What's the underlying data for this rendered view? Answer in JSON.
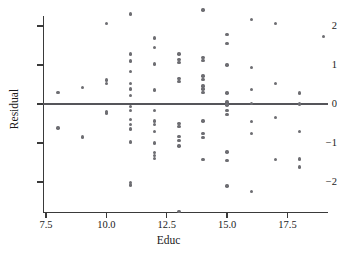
{
  "chart_data": {
    "type": "scatter",
    "title": "",
    "xlabel": "Educ",
    "ylabel": "Residual",
    "xlim": [
      7.2,
      19.6
    ],
    "ylim": [
      -2.85,
      2.55
    ],
    "xticks": [
      7.5,
      10.0,
      12.5,
      15.0,
      17.5
    ],
    "xticklabels": [
      "7.5",
      "10.0",
      "12.5",
      "15.0",
      "17.5"
    ],
    "yticks": [
      2,
      1,
      0,
      -1,
      -2
    ],
    "yticklabels": [
      "2",
      "1",
      "0",
      "−2",
      "−1"
    ],
    "ytick_labels": [
      "2",
      "1",
      "0",
      "−1",
      "−2"
    ],
    "grid": false,
    "legend": null,
    "marker_color": "#6d6d72",
    "reference_line": {
      "type": "horizontal",
      "y": 0,
      "color": "#55555a"
    },
    "points": [
      [
        8,
        0.29
      ],
      [
        8,
        -0.62
      ],
      [
        9,
        0.42
      ],
      [
        9,
        -0.85
      ],
      [
        10,
        2.07
      ],
      [
        10,
        0.62
      ],
      [
        10,
        0.52
      ],
      [
        10,
        -0.19
      ],
      [
        10,
        -0.23
      ],
      [
        11,
        2.31
      ],
      [
        11,
        1.28
      ],
      [
        11,
        1.1
      ],
      [
        11,
        0.83
      ],
      [
        11,
        0.52
      ],
      [
        11,
        0.38
      ],
      [
        11,
        0.22
      ],
      [
        11,
        -0.07
      ],
      [
        11,
        -0.16
      ],
      [
        11,
        -0.4
      ],
      [
        11,
        -0.52
      ],
      [
        11,
        -0.64
      ],
      [
        11,
        -0.97
      ],
      [
        11,
        -2.02
      ],
      [
        11,
        -2.08
      ],
      [
        12,
        1.69
      ],
      [
        12,
        1.45
      ],
      [
        12,
        1.03
      ],
      [
        12,
        0.36
      ],
      [
        12,
        -0.17
      ],
      [
        12,
        -0.44
      ],
      [
        12,
        -0.52
      ],
      [
        12,
        -0.7
      ],
      [
        12,
        -1.0
      ],
      [
        12,
        -1.24
      ],
      [
        12,
        -1.32
      ],
      [
        12,
        -1.39
      ],
      [
        13,
        1.28
      ],
      [
        13,
        1.14
      ],
      [
        13,
        1.06
      ],
      [
        13,
        0.66
      ],
      [
        13,
        0.57
      ],
      [
        13,
        -0.5
      ],
      [
        13,
        -0.57
      ],
      [
        13,
        -0.84
      ],
      [
        13,
        -0.93
      ],
      [
        13,
        -1.08
      ],
      [
        13,
        -2.75
      ],
      [
        14,
        2.41
      ],
      [
        14,
        1.2
      ],
      [
        14,
        1.12
      ],
      [
        14,
        0.72
      ],
      [
        14,
        0.63
      ],
      [
        14,
        0.46
      ],
      [
        14,
        0.38
      ],
      [
        14,
        0.3
      ],
      [
        14,
        -0.44
      ],
      [
        14,
        -0.75
      ],
      [
        14,
        -0.86
      ],
      [
        14,
        -1.42
      ],
      [
        15,
        1.78
      ],
      [
        15,
        1.55
      ],
      [
        15,
        1.0
      ],
      [
        15,
        0.28
      ],
      [
        15,
        0.05
      ],
      [
        15,
        -0.03
      ],
      [
        15,
        -0.17
      ],
      [
        15,
        -0.27
      ],
      [
        15,
        -1.23
      ],
      [
        15,
        -1.45
      ],
      [
        15,
        -2.1
      ],
      [
        16,
        2.17
      ],
      [
        16,
        0.93
      ],
      [
        16,
        0.37
      ],
      [
        16,
        0.02
      ],
      [
        16,
        -0.45
      ],
      [
        16,
        -0.75
      ],
      [
        16,
        -2.24
      ],
      [
        17,
        2.06
      ],
      [
        17,
        0.53
      ],
      [
        17,
        -0.34
      ],
      [
        17,
        -1.43
      ],
      [
        18,
        0.28
      ],
      [
        18,
        0.0
      ],
      [
        18,
        -0.7
      ],
      [
        18,
        -1.41
      ],
      [
        18,
        -1.62
      ],
      [
        19,
        1.73
      ]
    ]
  }
}
